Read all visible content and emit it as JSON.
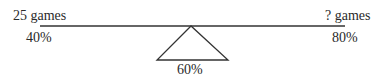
{
  "diagram": {
    "type": "seesaw-weighted-average",
    "left": {
      "quantity": "25 games",
      "percent": "40%"
    },
    "right": {
      "quantity": "? games",
      "percent": "80%"
    },
    "fulcrum": {
      "percent": "60%"
    },
    "colors": {
      "line": "#333333",
      "text": "#2a2a2a",
      "background": "#ffffff"
    }
  }
}
